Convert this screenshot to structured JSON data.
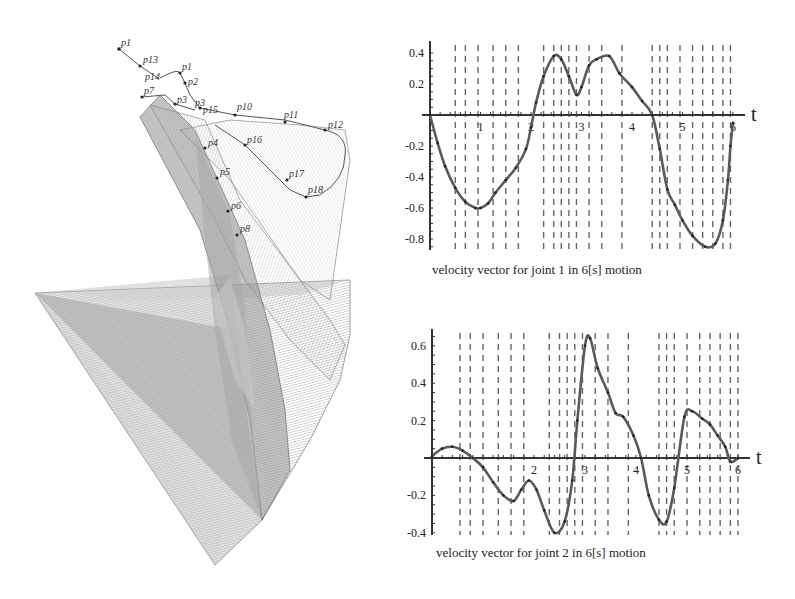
{
  "figure": {
    "left_panel": {
      "description": "3D swept surface of robot arm links with trajectory points",
      "point_labels": [
        "p1",
        "p13",
        "p14",
        "p1",
        "p2",
        "p7",
        "p3",
        "p15",
        "p10",
        "p11",
        "p12",
        "p16",
        "p4",
        "p17",
        "p18",
        "p5",
        "p6",
        "p8"
      ]
    },
    "axis_label_t": "t"
  },
  "chart_data": [
    {
      "type": "line",
      "title": "velocity vector for joint 1 in 6[s] motion",
      "xlabel": "t",
      "ylabel": "",
      "xlim": [
        0,
        6
      ],
      "ylim": [
        -0.88,
        0.42
      ],
      "x_ticks": [
        "1",
        "2",
        "3",
        "4",
        "5",
        "6"
      ],
      "y_ticks": [
        "0.4",
        "0.2",
        "-0.2",
        "-0.4",
        "-0.6",
        "-0.8"
      ],
      "grid": "vertical dashed lines",
      "series": [
        {
          "name": "joint 1 velocity",
          "x": [
            0,
            0.15,
            0.3,
            0.5,
            0.7,
            0.9,
            1.0,
            1.15,
            1.3,
            1.5,
            1.7,
            1.9,
            2.0,
            2.1,
            2.25,
            2.45,
            2.6,
            2.75,
            2.9,
            3.0,
            3.15,
            3.3,
            3.55,
            3.75,
            4.0,
            4.2,
            4.4,
            4.55,
            4.7,
            4.85,
            5.0,
            5.2,
            5.45,
            5.65,
            5.8,
            5.9,
            5.95,
            6.0
          ],
          "values": [
            0,
            -0.18,
            -0.33,
            -0.47,
            -0.56,
            -0.6,
            -0.6,
            -0.57,
            -0.5,
            -0.42,
            -0.34,
            -0.22,
            -0.08,
            0.08,
            0.25,
            0.38,
            0.36,
            0.25,
            0.13,
            0.18,
            0.32,
            0.36,
            0.38,
            0.27,
            0.18,
            0.09,
            0.0,
            -0.22,
            -0.48,
            -0.58,
            -0.68,
            -0.78,
            -0.85,
            -0.83,
            -0.68,
            -0.42,
            -0.2,
            -0.05
          ]
        }
      ]
    },
    {
      "type": "line",
      "title": "velocity vector for joint 2 in 6[s] motion",
      "xlabel": "t",
      "ylabel": "",
      "xlim": [
        0,
        6
      ],
      "ylim": [
        -0.42,
        0.66
      ],
      "x_ticks": [
        "2",
        "3",
        "4",
        "5",
        "6"
      ],
      "y_ticks": [
        "0.6",
        "0.4",
        "0.2",
        "-0.2",
        "-0.4"
      ],
      "grid": "vertical dashed lines",
      "series": [
        {
          "name": "joint 2 velocity",
          "x": [
            0,
            0.2,
            0.4,
            0.6,
            0.8,
            1.0,
            1.2,
            1.4,
            1.6,
            1.75,
            1.9,
            2.05,
            2.2,
            2.4,
            2.6,
            2.75,
            2.85,
            3.0,
            3.1,
            3.25,
            3.45,
            3.6,
            3.75,
            3.95,
            4.1,
            4.25,
            4.45,
            4.6,
            4.75,
            4.95,
            5.1,
            5.3,
            5.45,
            5.6,
            5.75,
            5.85,
            6.0
          ],
          "values": [
            0.01,
            0.05,
            0.06,
            0.04,
            0.0,
            -0.05,
            -0.13,
            -0.2,
            -0.23,
            -0.17,
            -0.12,
            -0.17,
            -0.28,
            -0.4,
            -0.34,
            -0.12,
            0.2,
            0.6,
            0.64,
            0.48,
            0.35,
            0.24,
            0.22,
            0.12,
            0.0,
            -0.2,
            -0.33,
            -0.34,
            -0.16,
            0.22,
            0.25,
            0.21,
            0.18,
            0.12,
            0.06,
            -0.02,
            0.0
          ]
        }
      ]
    }
  ]
}
